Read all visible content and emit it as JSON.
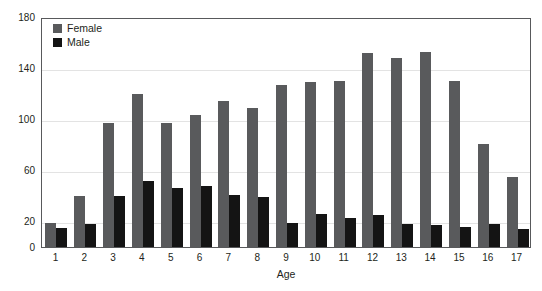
{
  "chart_data": {
    "type": "bar",
    "title": "",
    "xlabel": "Age",
    "ylabel": "",
    "categories": [
      "1",
      "2",
      "3",
      "4",
      "5",
      "6",
      "7",
      "8",
      "9",
      "10",
      "11",
      "12",
      "13",
      "14",
      "15",
      "16",
      "17"
    ],
    "series": [
      {
        "name": "Female",
        "color": "#595a5c",
        "values": [
          19,
          40,
          97,
          120,
          97,
          103,
          114,
          109,
          127,
          129,
          130,
          152,
          148,
          153,
          130,
          81,
          55
        ]
      },
      {
        "name": "Male",
        "color": "#141414",
        "values": [
          15,
          18,
          40,
          52,
          46,
          48,
          41,
          39,
          19,
          26,
          23,
          25,
          18,
          17,
          16,
          18,
          14
        ]
      }
    ],
    "ylim": [
      0,
      180
    ],
    "yticks": [
      0,
      20,
      60,
      100,
      140,
      180
    ],
    "grid": true,
    "legend_position": "top-left"
  },
  "axes": {
    "y_tick_labels": [
      "180",
      "140",
      "100",
      "60",
      "20",
      "0"
    ],
    "x_axis_title": "Age"
  },
  "legend": {
    "entries": [
      {
        "label": "Female",
        "swatch": "female-swatch"
      },
      {
        "label": "Male",
        "swatch": "male-swatch"
      }
    ]
  }
}
